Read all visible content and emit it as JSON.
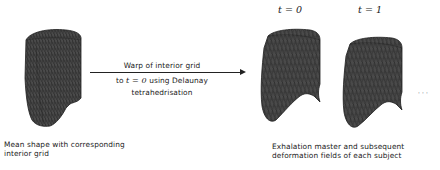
{
  "left_panel": {
    "caption_line1": "Mean shape with corresponding",
    "caption_line2": "interior grid"
  },
  "arrow": {
    "label_above": "Warp of interior grid",
    "label_below_line1_prefix": "to ",
    "label_below_line1_math": "t = 0",
    "label_below_line1_suffix": " using Delaunay",
    "label_below_line2": "tetrahedrisation"
  },
  "right_panel": {
    "frames": [
      {
        "label": "t = 0"
      },
      {
        "label": "t = 1"
      }
    ],
    "ellipsis": "· · ·",
    "caption_line1": "Exhalation master and subsequent",
    "caption_line2": "deformation fields of each subject"
  },
  "colors": {
    "mesh_fill": "#4a4a4a",
    "mesh_lines": "#1e1e1e",
    "arrow": "#222222",
    "text": "#1a1a1a"
  }
}
